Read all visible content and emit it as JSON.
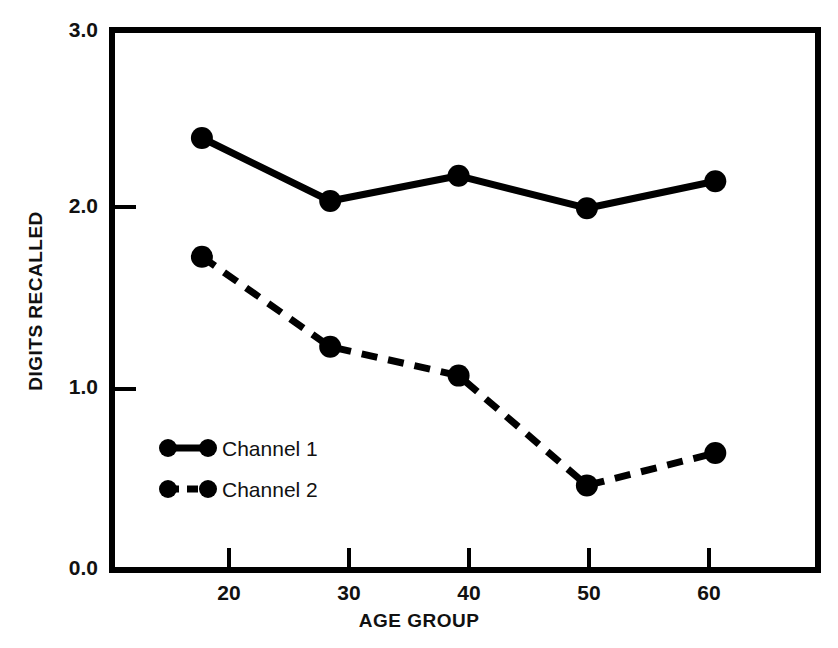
{
  "chart_data": {
    "type": "line",
    "title": "",
    "xlabel": "AGE GROUP",
    "ylabel": "DIGITS RECALLED",
    "categories": [
      20,
      30,
      40,
      50,
      60
    ],
    "x": [
      20,
      30,
      40,
      50,
      60
    ],
    "xtick_labels": [
      "20",
      "30",
      "40",
      "50",
      "60"
    ],
    "ytick_labels": [
      "0.0",
      "1.0",
      "2.0",
      "3.0"
    ],
    "ytick_values": [
      0.0,
      1.0,
      2.0,
      3.0
    ],
    "xlim": [
      13,
      68
    ],
    "ylim": [
      0.0,
      3.0
    ],
    "grid": false,
    "legend_position": "lower-left-inside",
    "series": [
      {
        "name": "Channel 1",
        "linestyle": "solid",
        "marker": "filled-circle",
        "color": "#000000",
        "values": [
          2.4,
          2.05,
          2.19,
          2.01,
          2.16
        ]
      },
      {
        "name": "Channel 2",
        "linestyle": "dashed",
        "marker": "filled-circle",
        "color": "#000000",
        "values": [
          1.74,
          1.24,
          1.08,
          0.47,
          0.65
        ]
      }
    ]
  },
  "axes": {
    "y_title": "DIGITS RECALLED",
    "x_title": "AGE GROUP",
    "ytick_labels": [
      "3.0",
      "2.0",
      "1.0",
      "0.0"
    ],
    "xtick_labels": [
      "20",
      "30",
      "40",
      "50",
      "60"
    ]
  },
  "legend": {
    "entries": [
      {
        "label": "Channel 1",
        "style": "solid"
      },
      {
        "label": "Channel 2",
        "style": "dashed"
      }
    ]
  },
  "style": {
    "ink": "#000000",
    "paper": "#ffffff"
  }
}
